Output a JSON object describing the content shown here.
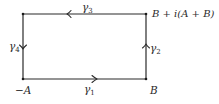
{
  "diagram": {
    "vertices": {
      "top_left": {
        "x": 23,
        "y": 14
      },
      "top_right": {
        "x": 146,
        "y": 14
      },
      "bottom_right": {
        "x": 146,
        "y": 79
      },
      "bottom_left": {
        "x": 23,
        "y": 79
      }
    },
    "corner_labels": {
      "bottom_left": "−A",
      "bottom_right": "B",
      "top_right": "B + i(A + B)"
    },
    "edges": [
      {
        "name": "gamma-1",
        "label_base": "γ",
        "label_sub": "1",
        "from": "−A",
        "to": "B",
        "direction": "right"
      },
      {
        "name": "gamma-2",
        "label_base": "γ",
        "label_sub": "2",
        "from": "B",
        "to": "B + i(A + B)",
        "direction": "up"
      },
      {
        "name": "gamma-3",
        "label_base": "γ",
        "label_sub": "3",
        "from": "B + i(A + B)",
        "to": "top-left",
        "direction": "left"
      },
      {
        "name": "gamma-4",
        "label_base": "γ",
        "label_sub": "4",
        "from": "top-left",
        "to": "−A",
        "direction": "down"
      }
    ],
    "colors": {
      "line": "#2a2a2a",
      "background": "#ffffff"
    }
  }
}
